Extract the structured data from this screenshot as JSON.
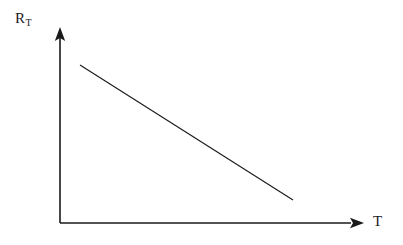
{
  "figure": {
    "background_color": "#ffffff",
    "line_color": "#1a1a1a",
    "axis_color": "#1a1a1a",
    "width": 403,
    "height": 245
  },
  "axes": {
    "y_axis": {
      "name": "y-axis",
      "label_main": "R",
      "label_subscript": "T",
      "arrow": "arrow-up"
    },
    "x_axis": {
      "name": "x-axis",
      "label_main": "T",
      "label_subscript": "",
      "arrow": "arrow-right"
    }
  },
  "chart_data": {
    "type": "line",
    "title": "",
    "subtitle": "",
    "xlabel": "T",
    "ylabel": "R_T",
    "grid": false,
    "legend": null,
    "xlim": [
      0,
      1
    ],
    "ylim": [
      0,
      1
    ],
    "axis_ticks": {
      "x": [],
      "y": []
    },
    "annotations": [],
    "series": [
      {
        "name": "R_T vs T",
        "style": "solid-straight-line",
        "description": "Negative temperature coefficient: thermistor resistance decreases linearly as temperature increases",
        "x": [
          0.069,
          1.0
        ],
        "y": [
          1.0,
          0.3
        ],
        "points_px": [
          [
            80,
            65
          ],
          [
            293,
            200
          ]
        ]
      }
    ]
  }
}
